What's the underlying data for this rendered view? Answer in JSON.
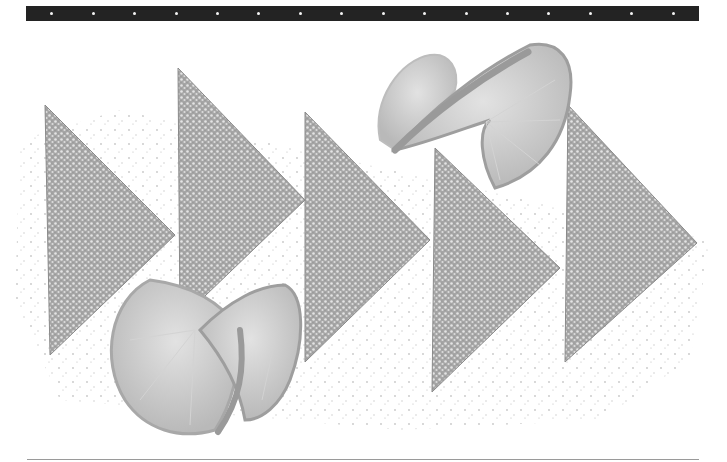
{
  "image": {
    "description": "Grayscale food photograph: five sugar-dusted triangular toast slices arranged in a row like play/fast-forward arrows, with two twisted lemon slices, on a white background scattered with sugar crumbs",
    "subjects": [
      "triangle-toast",
      "triangle-toast",
      "triangle-toast",
      "triangle-toast",
      "triangle-toast",
      "lemon-slice",
      "lemon-slice"
    ],
    "film_strip": {
      "sprocket_count": 16,
      "color": "#232323",
      "hole_color": "#f4f4f4"
    },
    "palette": {
      "background": "#ffffff",
      "toast": "#a9a9a9",
      "toast_dark": "#8c8c8c",
      "sugar": "#e6e6e6",
      "lemon": "#c4c4c4",
      "lemon_rind": "#9e9e9e",
      "rule": "#9a9a9a"
    }
  }
}
